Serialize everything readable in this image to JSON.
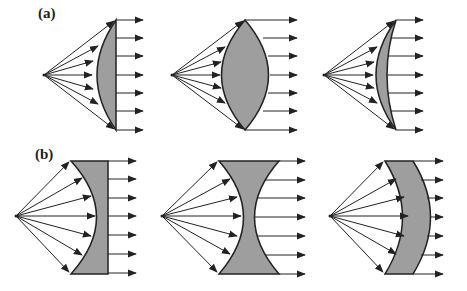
{
  "figure": {
    "colors": {
      "lens_fill": "#9e9e9e",
      "stroke": "#222222",
      "background": "#ffffff"
    },
    "rows": [
      {
        "label": "(a)",
        "kind": "convex lenses",
        "panels": [
          {
            "name": "plano-convex",
            "source": [
              44,
              75
            ]
          },
          {
            "name": "biconvex",
            "source": [
              172,
              75
            ]
          },
          {
            "name": "convex-meniscus",
            "source": [
              324,
              75
            ]
          }
        ]
      },
      {
        "label": "(b)",
        "kind": "concave lenses",
        "panels": [
          {
            "name": "plano-concave",
            "source": [
              16,
              216
            ]
          },
          {
            "name": "biconcave",
            "source": [
              162,
              216
            ]
          },
          {
            "name": "concave-meniscus",
            "source": [
              330,
              216
            ]
          }
        ]
      }
    ]
  }
}
